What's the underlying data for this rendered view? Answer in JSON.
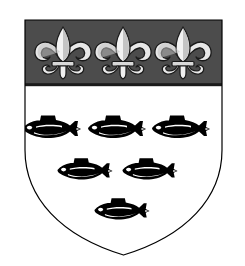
{
  "image": {
    "title": "Coat of Arms",
    "subject": "heraldic-shield",
    "description": "Escutcheon with a chief charged with three fleurs-de-lis, the field charged with six fish naiant in three rows",
    "background_color": "#ffffff"
  },
  "shield": {
    "name": "escutcheon",
    "outline_color": "#000000",
    "outline_width": 1.2,
    "field_color": "#ffffff",
    "geometry": {
      "left": 25,
      "right": 222,
      "top": 20,
      "bottom": 255,
      "shoulder_y": 150,
      "point_x": 123.5
    }
  },
  "chief": {
    "name": "chief",
    "tincture_label": "sable",
    "fill_color": "#4c4c4c",
    "border_color": "#1a1a1a",
    "top": 20,
    "bottom": 86,
    "charge_count": 3,
    "charge_label": "fleur-de-lis"
  },
  "fleurs": {
    "label": "fleur-de-lis",
    "fill_color": "#e8e8e8",
    "shade_color": "#9a9a9a",
    "outline_color": "#1a1a1a",
    "items": [
      {
        "name": "fleur-de-lis-1",
        "cx": 63,
        "cy": 53,
        "scale": 1.0
      },
      {
        "name": "fleur-de-lis-2",
        "cx": 123,
        "cy": 53,
        "scale": 1.0
      },
      {
        "name": "fleur-de-lis-3",
        "cx": 183,
        "cy": 53,
        "scale": 1.0
      }
    ]
  },
  "fish": {
    "label": "fish-naiant",
    "fill_color": "#000000",
    "belly_color": "#ffffff",
    "eye_color": "#ffffff",
    "rows": [
      {
        "name": "fish-row-top",
        "count": 3,
        "items": [
          {
            "name": "fish-1",
            "cx": 52,
            "cy": 128,
            "scale": 1.0
          },
          {
            "name": "fish-2",
            "cx": 117,
            "cy": 128,
            "scale": 1.0
          },
          {
            "name": "fish-3",
            "cx": 181,
            "cy": 128,
            "scale": 1.0
          }
        ]
      },
      {
        "name": "fish-row-middle",
        "count": 2,
        "items": [
          {
            "name": "fish-4",
            "cx": 85,
            "cy": 170,
            "scale": 0.95
          },
          {
            "name": "fish-5",
            "cx": 150,
            "cy": 170,
            "scale": 0.95
          }
        ]
      },
      {
        "name": "fish-row-bottom",
        "count": 1,
        "items": [
          {
            "name": "fish-6",
            "cx": 122,
            "cy": 210,
            "scale": 0.95
          }
        ]
      }
    ]
  }
}
